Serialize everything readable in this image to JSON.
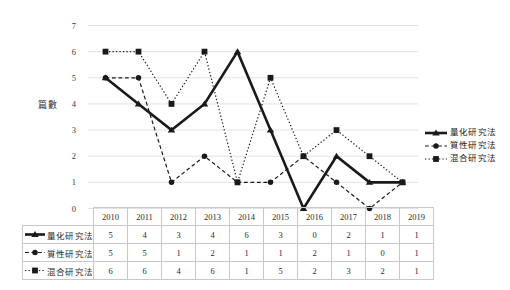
{
  "chart_data": {
    "type": "line",
    "title": "",
    "subtitle": "",
    "xlabel": "",
    "ylabel": "篇數",
    "categories": [
      "2010",
      "2011",
      "2012",
      "2013",
      "2014",
      "2015",
      "2016",
      "2017",
      "2018",
      "2019"
    ],
    "ylim": [
      0,
      7
    ],
    "yticks": [
      "0",
      "1",
      "2",
      "3",
      "4",
      "5",
      "6",
      "7"
    ],
    "grid": true,
    "legend_position": "right",
    "series": [
      {
        "name": "量化研究法",
        "values": [
          5,
          4,
          3,
          4,
          6,
          3,
          0,
          2,
          1,
          1
        ],
        "marker": "triangle",
        "line_style": "solid",
        "line_width": 2.6,
        "color": "#1a1a1a"
      },
      {
        "name": "質性研究法",
        "values": [
          5,
          5,
          1,
          2,
          1,
          1,
          2,
          1,
          0,
          1
        ],
        "marker": "circle",
        "line_style": "dashed",
        "line_width": 1.2,
        "color": "#1a1a1a"
      },
      {
        "name": "混合研究法",
        "values": [
          6,
          6,
          4,
          6,
          1,
          5,
          2,
          3,
          2,
          1
        ],
        "marker": "square",
        "line_style": "dotted",
        "line_width": 1.2,
        "color": "#1a1a1a"
      }
    ]
  },
  "legend": {
    "items": [
      {
        "label": "量化研究法",
        "marker": "triangle",
        "line_style": "solid"
      },
      {
        "label": "質性研究法",
        "marker": "circle",
        "line_style": "dashed"
      },
      {
        "label": "混合研究法",
        "marker": "square",
        "line_style": "dotted"
      }
    ]
  },
  "data_table": {
    "corner_label": "",
    "column_headers": [
      "2010",
      "2011",
      "2012",
      "2013",
      "2014",
      "2015",
      "2016",
      "2017",
      "2018",
      "2019"
    ],
    "rows": [
      {
        "label": "量化研究法",
        "marker": "triangle",
        "line_style": "solid",
        "values": [
          "5",
          "4",
          "3",
          "4",
          "6",
          "3",
          "0",
          "2",
          "1",
          "1"
        ]
      },
      {
        "label": "質性研究法",
        "marker": "circle",
        "line_style": "dashed",
        "values": [
          "5",
          "5",
          "1",
          "2",
          "1",
          "1",
          "2",
          "1",
          "0",
          "1"
        ]
      },
      {
        "label": "混合研究法",
        "marker": "square",
        "line_style": "dotted",
        "values": [
          "6",
          "6",
          "4",
          "6",
          "1",
          "5",
          "2",
          "3",
          "2",
          "1"
        ]
      }
    ]
  },
  "colors": {
    "line": "#1a1a1a",
    "grid": "#e2e2e2",
    "table_border": "#c8c8c8",
    "text": "#2b2b2b"
  }
}
